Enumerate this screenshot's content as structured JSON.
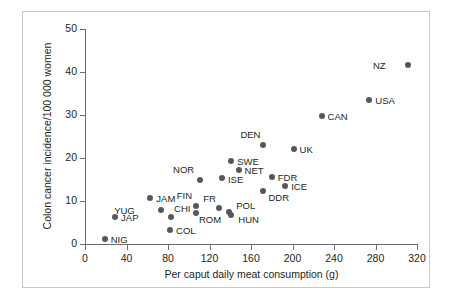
{
  "figure": {
    "border_color": "#c9c9c9",
    "marker_color": "#58585b",
    "axis_color": "#6d6e71"
  },
  "chart_data": {
    "type": "scatter",
    "title": "",
    "xlabel": "Per caput daily meat consumption (g)",
    "ylabel": "Colon cancer incidence/100 000 women",
    "xlim": [
      0,
      320
    ],
    "ylim": [
      0,
      50
    ],
    "xticks": [
      0,
      40,
      80,
      120,
      160,
      200,
      240,
      280,
      320
    ],
    "yticks": [
      0,
      10,
      20,
      30,
      40,
      50
    ],
    "grid": false,
    "legend": "none",
    "points": [
      {
        "label": "NIG",
        "x": 19,
        "y": 1.2,
        "lx": 6,
        "ly": -4
      },
      {
        "label": "JAP",
        "x": 29,
        "y": 6.3,
        "lx": 6,
        "ly": -4
      },
      {
        "label": "JAM",
        "x": 63,
        "y": 10.7,
        "lx": 6,
        "ly": -4
      },
      {
        "label": "YUG",
        "x": 73,
        "y": 7.8,
        "lx": -26,
        "ly": -4
      },
      {
        "label": "CHI",
        "x": 83,
        "y": 6.2,
        "lx": 3,
        "ly": -13
      },
      {
        "label": "COL",
        "x": 82,
        "y": 3.3,
        "lx": 6,
        "ly": -4
      },
      {
        "label": "FIN",
        "x": 107,
        "y": 8.8,
        "lx": -4,
        "ly": -15
      },
      {
        "label": "ROM",
        "x": 107,
        "y": 7.2,
        "lx": 3,
        "ly": 2
      },
      {
        "label": "NOR",
        "x": 111,
        "y": 14.9,
        "lx": -6,
        "ly": -15
      },
      {
        "label": "FR",
        "x": 129,
        "y": 8.3,
        "lx": -3,
        "ly": -14
      },
      {
        "label": "ISE",
        "x": 132,
        "y": 15.4,
        "lx": 6,
        "ly": -3
      },
      {
        "label": "POL",
        "x": 139,
        "y": 7.5,
        "lx": 7,
        "ly": -11
      },
      {
        "label": "HUN",
        "x": 141,
        "y": 6.7,
        "lx": 7,
        "ly": 0
      },
      {
        "label": "SWE",
        "x": 141,
        "y": 19.3,
        "lx": 6,
        "ly": -4
      },
      {
        "label": "NET",
        "x": 148,
        "y": 17.3,
        "lx": 6,
        "ly": -4
      },
      {
        "label": "DEN",
        "x": 172,
        "y": 23.1,
        "lx": -3,
        "ly": -15
      },
      {
        "label": "DDR",
        "x": 172,
        "y": 12.3,
        "lx": 5,
        "ly": 2
      },
      {
        "label": "FDR",
        "x": 180,
        "y": 15.5,
        "lx": 6,
        "ly": -4
      },
      {
        "label": "ICE",
        "x": 193,
        "y": 13.4,
        "lx": 6,
        "ly": -4
      },
      {
        "label": "UK",
        "x": 201,
        "y": 22.1,
        "lx": 6,
        "ly": -4
      },
      {
        "label": "CAN",
        "x": 228,
        "y": 29.7,
        "lx": 6,
        "ly": -4
      },
      {
        "label": "USA",
        "x": 274,
        "y": 33.4,
        "lx": 6,
        "ly": -4
      },
      {
        "label": "NZ",
        "x": 311,
        "y": 41.6,
        "lx": -22,
        "ly": -4
      }
    ]
  }
}
